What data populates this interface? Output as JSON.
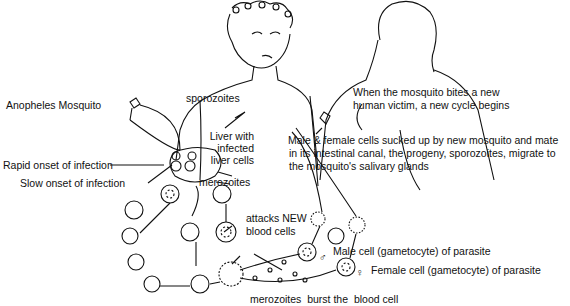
{
  "diagram": {
    "labels": {
      "anopheles": "Anopheles Mosquito",
      "sporozoites": "sporozoites",
      "liver_1": "Liver with",
      "liver_2": "infected",
      "liver_3": "liver cells",
      "rapid": "Rapid onset of infection",
      "slow": "Slow onset of infection",
      "merozoites": "merozoites",
      "new_cycle_1": "When the mosquito bites a new",
      "new_cycle_2": "human victim, a new cycle begins",
      "sucked_1": "Male & female cells sucked up by new mosquito and mate",
      "sucked_2": "in its intestinal canal, the progeny, sporozoites, migrate to",
      "sucked_3": "the mosquito's salivary glands",
      "attacks_1": "attacks NEW",
      "attacks_2": "blood cells",
      "male": "Male cell (gametocyte) of parasite",
      "female": "Female cell (gametocyte) of parasite",
      "burst": "merozoites  burst the  blood cell"
    },
    "symbols": {
      "male": "♂",
      "female": "♀"
    }
  }
}
